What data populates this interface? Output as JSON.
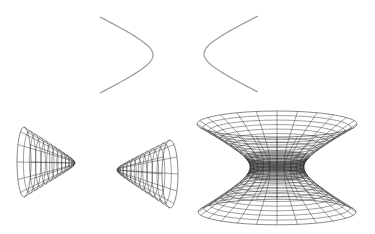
{
  "figure": {
    "width": 375,
    "height": 234,
    "background": "#ffffff",
    "curve_color": "#9a9a9a",
    "mesh_color": "#2a2a2a"
  },
  "hyperbola_2d": {
    "label": "hyperbola",
    "left_branch": {
      "vertex": [
        153,
        55
      ],
      "ends": [
        [
          100,
          17
        ],
        [
          100,
          93
        ]
      ]
    },
    "right_branch": {
      "vertex": [
        204,
        54
      ],
      "ends": [
        [
          258,
          17
        ],
        [
          258,
          93
        ]
      ]
    }
  },
  "hyperboloid_two_sheets": {
    "label": "hyperboloid of two sheets",
    "left_nappe": {
      "tip": [
        75,
        163
      ],
      "rim_center_x": 24,
      "rim_cy": 162,
      "rim_rx": 7,
      "rim_ry": 35,
      "rings": 12,
      "meridians": 12
    },
    "right_nappe": {
      "tip": [
        117,
        170
      ],
      "rim_center_x": 170,
      "rim_cy": 174,
      "rim_rx": 8,
      "rim_ry": 34,
      "rings": 12,
      "meridians": 12
    }
  },
  "hyperboloid_one_sheet": {
    "label": "hyperboloid of one sheet",
    "center_x": 277,
    "waist_y": 167,
    "waist_rx": 27,
    "top_y": 124,
    "bottom_y": 212,
    "top_rx": 80,
    "bottom_rx": 79,
    "rim_ry": 13,
    "rings": 24,
    "meridians": 24
  }
}
